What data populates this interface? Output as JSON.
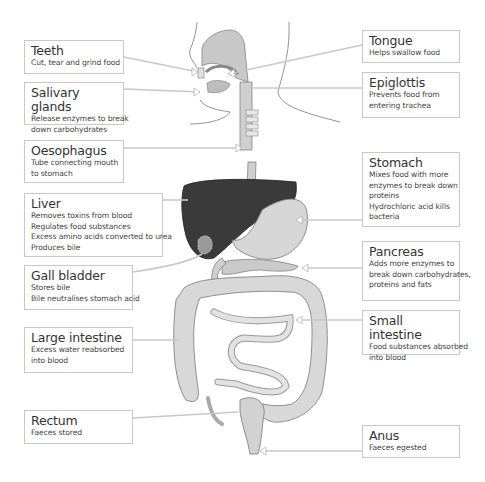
{
  "diagram": {
    "colors": {
      "liver": "#3a3a3a",
      "organ_fill": "#d4d4d4",
      "organ_light": "#e6e6e6",
      "outline": "#7a7a7a",
      "pointer": "#cccccc",
      "box_border": "#c8c8c8"
    },
    "labels": {
      "teeth": {
        "title": "Teeth",
        "desc": [
          "Cut, tear and grind food"
        ]
      },
      "salivary": {
        "title": "Salivary glands",
        "desc": [
          "Release enzymes to break",
          "down carbohydrates"
        ]
      },
      "oesophagus": {
        "title": "Oesophagus",
        "desc": [
          "Tube connecting mouth",
          "to stomach"
        ]
      },
      "liver": {
        "title": "Liver",
        "desc": [
          "Removes toxins from blood",
          "Regulates food substances",
          "Excess amino acids converted to urea",
          "Produces bile"
        ]
      },
      "gall": {
        "title": "Gall bladder",
        "desc": [
          "Stores bile",
          "Bile neutralises stomach acid"
        ]
      },
      "large": {
        "title": "Large intestine",
        "desc": [
          "Excess water reabsorbed",
          "into blood"
        ]
      },
      "rectum": {
        "title": "Rectum",
        "desc": [
          "Faeces stored"
        ]
      },
      "tongue": {
        "title": "Tongue",
        "desc": [
          "Helps swallow food"
        ]
      },
      "epiglottis": {
        "title": "Epiglottis",
        "desc": [
          "Prevents food from",
          "entering trachea"
        ]
      },
      "stomach": {
        "title": "Stomach",
        "desc": [
          "Mixes food with more",
          "enzymes to break down",
          "proteins",
          "Hydrochloric acid kills",
          "bacteria"
        ]
      },
      "pancreas": {
        "title": "Pancreas",
        "desc": [
          "Adds more enzymes to",
          "break down carbohydrates,",
          "proteins and fats"
        ]
      },
      "small": {
        "title": "Small intestine",
        "desc": [
          "Food substances absorbed",
          "into blood"
        ]
      },
      "anus": {
        "title": "Anus",
        "desc": [
          "Faeces egested"
        ]
      }
    }
  }
}
